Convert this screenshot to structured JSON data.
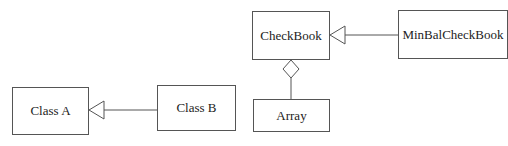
{
  "diagram": {
    "type": "UML class diagram",
    "classes": {
      "class_a": "Class A",
      "class_b": "Class B",
      "checkbook": "CheckBook",
      "minbal": "MinBalCheckBook",
      "array": "Array"
    },
    "relations": [
      {
        "from": "Class B",
        "to": "Class A",
        "kind": "generalization"
      },
      {
        "from": "MinBalCheckBook",
        "to": "CheckBook",
        "kind": "generalization"
      },
      {
        "from": "Array",
        "to": "CheckBook",
        "kind": "aggregation"
      }
    ],
    "colors": {
      "stroke": "#555555",
      "background": "#ffffff",
      "text": "#222222"
    }
  }
}
